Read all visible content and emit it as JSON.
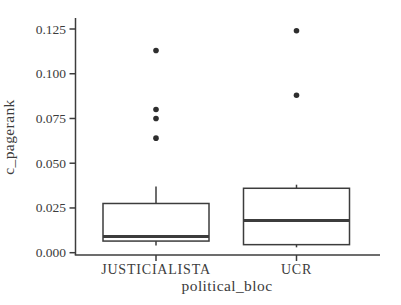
{
  "figure": {
    "background": "#ffffff",
    "stroke_color": "#3c3c3c",
    "point_color": "#2e2e2e",
    "text_color": "#3c3c3c"
  },
  "chart_data": {
    "type": "boxplot",
    "title": "",
    "xlabel": "political_bloc",
    "ylabel": "c_pagerank",
    "categories": [
      "JUSTICIALISTA",
      "UCR"
    ],
    "y_tick_labels": [
      "0.000",
      "0.025",
      "0.050",
      "0.075",
      "0.100",
      "0.125"
    ],
    "y_tick_values": [
      0,
      0.025,
      0.05,
      0.075,
      0.1,
      0.125
    ],
    "ylim": [
      -0.0013,
      0.1312
    ],
    "grid": false,
    "legend": false,
    "series": [
      {
        "category": "JUSTICIALISTA",
        "whisker_low": 0.004,
        "q1": 0.0065,
        "median": 0.009,
        "q3": 0.0275,
        "whisker_high": 0.037,
        "outliers": [
          0.064,
          0.075,
          0.08,
          0.113
        ]
      },
      {
        "category": "UCR",
        "whisker_low": 0.003,
        "q1": 0.0045,
        "median": 0.018,
        "q3": 0.036,
        "whisker_high": 0.038,
        "outliers": [
          0.088,
          0.124
        ]
      }
    ]
  }
}
